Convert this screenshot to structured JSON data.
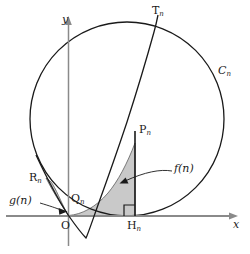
{
  "figure": {
    "kind": "geometry-diagram",
    "background_color": "#ffffff",
    "stroke_color": "#1a1a1a",
    "axis_color": "#808080",
    "shade_color": "#c9c9c9",
    "shade_stroke": "#4a4a4a"
  },
  "axes": {
    "x_label": "x",
    "y_label": "y",
    "origin_label": "O"
  },
  "points": {
    "T": {
      "base": "T",
      "sub": "n"
    },
    "P": {
      "base": "P",
      "sub": "n"
    },
    "Q": {
      "base": "Q",
      "sub": "n"
    },
    "R": {
      "base": "R",
      "sub": "n"
    },
    "H": {
      "base": "H",
      "sub": "n"
    }
  },
  "curves": {
    "circle": {
      "base": "C",
      "sub": "n"
    }
  },
  "regions": {
    "f_label": "f(n)",
    "g_label": "g(n)"
  },
  "markers": {
    "right_angle": "right-angle-marker"
  }
}
